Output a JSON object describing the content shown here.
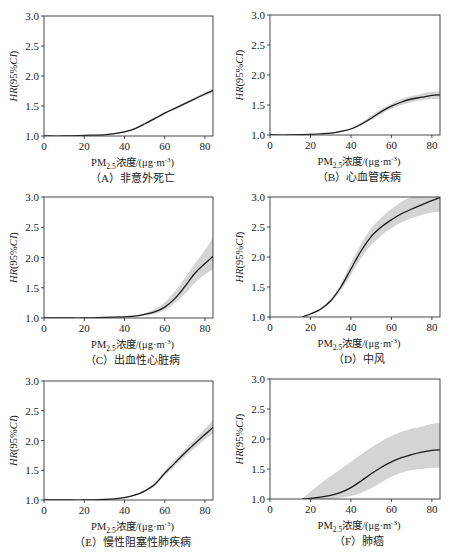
{
  "figure": {
    "y_axis_label": "HR(95%CI)",
    "x_axis_label": "PM2.5浓度/(μg·m⁻³)",
    "x_axis_label_parts": {
      "pre": "PM",
      "sub": "2.5",
      "post": "浓度/(μg·m",
      "sup": "-3",
      "end": ")"
    },
    "line_color": "#1a1a1a",
    "band_color": "#d4d4d4"
  },
  "chart_data": [
    {
      "id": "A",
      "type": "line",
      "caption": "（A）非意外死亡",
      "title": "非意外死亡",
      "xlabel": "PM2.5浓度/(μg·m⁻³)",
      "ylabel": "HR(95%CI)",
      "xlim": [
        0,
        84
      ],
      "ylim": [
        1.0,
        3.0
      ],
      "xticks": [
        0,
        20,
        40,
        60,
        80
      ],
      "yticks": [
        1.0,
        1.5,
        2.0,
        2.5,
        3.0
      ],
      "grid": false,
      "legend": null,
      "x": [
        0,
        10,
        20,
        30,
        35,
        40,
        45,
        50,
        55,
        60,
        65,
        70,
        75,
        80,
        84
      ],
      "hr": [
        1.0,
        1.0,
        1.01,
        1.02,
        1.04,
        1.07,
        1.12,
        1.2,
        1.29,
        1.38,
        1.46,
        1.54,
        1.62,
        1.7,
        1.76
      ],
      "lower": [
        1.0,
        1.0,
        1.01,
        1.02,
        1.035,
        1.06,
        1.11,
        1.19,
        1.27,
        1.36,
        1.44,
        1.52,
        1.6,
        1.67,
        1.73
      ],
      "upper": [
        1.0,
        1.0,
        1.01,
        1.025,
        1.045,
        1.08,
        1.13,
        1.22,
        1.31,
        1.4,
        1.48,
        1.56,
        1.64,
        1.73,
        1.79
      ]
    },
    {
      "id": "B",
      "type": "line",
      "caption": "（B）心血管疾病",
      "title": "心血管疾病",
      "xlabel": "PM2.5浓度/(μg·m⁻³)",
      "ylabel": "HR(95%CI)",
      "xlim": [
        0,
        84
      ],
      "ylim": [
        1.0,
        3.0
      ],
      "xticks": [
        0,
        20,
        40,
        60,
        80
      ],
      "yticks": [
        1.0,
        1.5,
        2.0,
        2.5,
        3.0
      ],
      "grid": false,
      "legend": null,
      "x": [
        0,
        10,
        20,
        30,
        35,
        40,
        45,
        50,
        55,
        60,
        65,
        70,
        75,
        80,
        84
      ],
      "hr": [
        1.0,
        1.0,
        1.01,
        1.03,
        1.06,
        1.1,
        1.18,
        1.28,
        1.39,
        1.48,
        1.55,
        1.6,
        1.63,
        1.66,
        1.67
      ],
      "lower": [
        1.0,
        1.0,
        1.01,
        1.025,
        1.05,
        1.09,
        1.16,
        1.25,
        1.35,
        1.44,
        1.5,
        1.55,
        1.58,
        1.6,
        1.61
      ],
      "upper": [
        1.0,
        1.0,
        1.015,
        1.035,
        1.07,
        1.12,
        1.21,
        1.32,
        1.43,
        1.52,
        1.6,
        1.65,
        1.69,
        1.72,
        1.73
      ]
    },
    {
      "id": "C",
      "type": "line",
      "caption": "（C）出血性心脏病",
      "title": "出血性心脏病",
      "xlabel": "PM2.5浓度/(μg·m⁻³)",
      "ylabel": "HR(95%CI)",
      "xlim": [
        0,
        84
      ],
      "ylim": [
        1.0,
        3.0
      ],
      "xticks": [
        0,
        20,
        40,
        60,
        80
      ],
      "yticks": [
        1.0,
        1.5,
        2.0,
        2.5,
        3.0
      ],
      "grid": false,
      "legend": null,
      "x": [
        0,
        10,
        20,
        30,
        40,
        45,
        50,
        55,
        60,
        65,
        70,
        75,
        80,
        84
      ],
      "hr": [
        1.0,
        1.0,
        1.0,
        1.01,
        1.02,
        1.03,
        1.06,
        1.1,
        1.18,
        1.32,
        1.52,
        1.74,
        1.9,
        2.02
      ],
      "lower": [
        1.0,
        1.0,
        1.0,
        1.01,
        1.02,
        1.03,
        1.04,
        1.07,
        1.13,
        1.25,
        1.4,
        1.58,
        1.72,
        1.8
      ],
      "upper": [
        1.0,
        1.0,
        1.0,
        1.01,
        1.025,
        1.04,
        1.08,
        1.15,
        1.26,
        1.44,
        1.66,
        1.9,
        2.12,
        2.33
      ]
    },
    {
      "id": "D",
      "type": "line",
      "caption": "（D）中风",
      "title": "中风",
      "xlabel": "PM2.5浓度/(μg·m⁻³)",
      "ylabel": "HR(95%CI)",
      "xlim": [
        0,
        84
      ],
      "ylim": [
        1.0,
        3.0
      ],
      "xticks": [
        0,
        20,
        40,
        60,
        80
      ],
      "yticks": [
        1.0,
        1.5,
        2.0,
        2.5,
        3.0
      ],
      "grid": false,
      "legend": null,
      "x": [
        16,
        20,
        25,
        30,
        35,
        40,
        45,
        50,
        55,
        60,
        65,
        70,
        75,
        80,
        84
      ],
      "hr": [
        1.0,
        1.05,
        1.13,
        1.27,
        1.5,
        1.8,
        2.1,
        2.34,
        2.5,
        2.62,
        2.72,
        2.8,
        2.87,
        2.94,
        2.99
      ],
      "lower": [
        1.0,
        1.04,
        1.12,
        1.24,
        1.44,
        1.7,
        1.98,
        2.2,
        2.36,
        2.48,
        2.58,
        2.65,
        2.7,
        2.74,
        2.76
      ],
      "upper": [
        1.0,
        1.06,
        1.15,
        1.3,
        1.56,
        1.9,
        2.22,
        2.48,
        2.66,
        2.8,
        2.92,
        3.0,
        3.0,
        3.0,
        3.0
      ]
    },
    {
      "id": "E",
      "type": "line",
      "caption": "（E）慢性阻塞性肺疾病",
      "title": "慢性阻塞性肺疾病",
      "xlabel": "PM2.5浓度/(μg·m⁻³)",
      "ylabel": "HR(95%CI)",
      "xlim": [
        0,
        84
      ],
      "ylim": [
        1.0,
        3.0
      ],
      "xticks": [
        0,
        20,
        40,
        60,
        80
      ],
      "yticks": [
        1.0,
        1.5,
        2.0,
        2.5,
        3.0
      ],
      "grid": false,
      "legend": null,
      "x": [
        0,
        10,
        20,
        30,
        35,
        40,
        45,
        50,
        55,
        60,
        65,
        70,
        75,
        80,
        84
      ],
      "hr": [
        1.0,
        1.0,
        1.0,
        1.01,
        1.02,
        1.04,
        1.08,
        1.15,
        1.26,
        1.45,
        1.62,
        1.79,
        1.95,
        2.1,
        2.22
      ],
      "lower": [
        1.0,
        1.0,
        1.0,
        1.01,
        1.02,
        1.035,
        1.07,
        1.13,
        1.23,
        1.41,
        1.57,
        1.73,
        1.88,
        2.02,
        2.12
      ],
      "upper": [
        1.0,
        1.0,
        1.0,
        1.01,
        1.025,
        1.045,
        1.09,
        1.17,
        1.29,
        1.49,
        1.67,
        1.85,
        2.02,
        2.2,
        2.34
      ]
    },
    {
      "id": "F",
      "type": "line",
      "caption": "（F）肺癌",
      "title": "肺癌",
      "xlabel": "PM2.5浓度/(μg·m⁻³)",
      "ylabel": "HR(95%CI)",
      "xlim": [
        0,
        84
      ],
      "ylim": [
        1.0,
        3.0
      ],
      "xticks": [
        0,
        20,
        40,
        60,
        80
      ],
      "yticks": [
        1.0,
        1.5,
        2.0,
        2.5,
        3.0
      ],
      "grid": false,
      "legend": null,
      "x": [
        16,
        20,
        25,
        30,
        35,
        40,
        45,
        50,
        55,
        60,
        65,
        70,
        75,
        80,
        84
      ],
      "hr": [
        1.0,
        1.01,
        1.03,
        1.06,
        1.11,
        1.19,
        1.3,
        1.42,
        1.53,
        1.62,
        1.69,
        1.74,
        1.78,
        1.81,
        1.82
      ],
      "lower": [
        1.0,
        1.0,
        1.0,
        1.0,
        1.02,
        1.05,
        1.1,
        1.18,
        1.28,
        1.37,
        1.44,
        1.48,
        1.5,
        1.52,
        1.52
      ],
      "upper": [
        1.0,
        1.12,
        1.26,
        1.38,
        1.5,
        1.62,
        1.74,
        1.86,
        1.96,
        2.05,
        2.12,
        2.17,
        2.21,
        2.25,
        2.27
      ]
    }
  ]
}
